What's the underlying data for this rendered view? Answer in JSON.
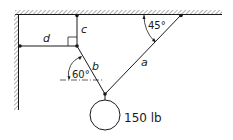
{
  "diagram": {
    "type": "statics-cable-system",
    "labels": {
      "cable_a": "a",
      "cable_b": "b",
      "cable_c": "c",
      "cable_d": "d",
      "angle_a": "45°",
      "angle_b": "60°",
      "weight": "150 lb"
    },
    "elements": [
      {
        "name": "cable-a",
        "from": "ceiling",
        "to": "weight-junction",
        "angle_from_ceiling_deg": 45
      },
      {
        "name": "cable-b",
        "from": "upper-junction",
        "to": "weight-junction",
        "angle_from_horizontal_deg": 60
      },
      {
        "name": "cable-c",
        "from": "ceiling",
        "to": "upper-junction",
        "orientation": "vertical"
      },
      {
        "name": "cable-d",
        "from": "wall",
        "to": "upper-junction",
        "orientation": "horizontal"
      }
    ],
    "colors": {
      "line": "#1a1a1a",
      "hatch": "#888888",
      "background": "#ffffff"
    }
  }
}
